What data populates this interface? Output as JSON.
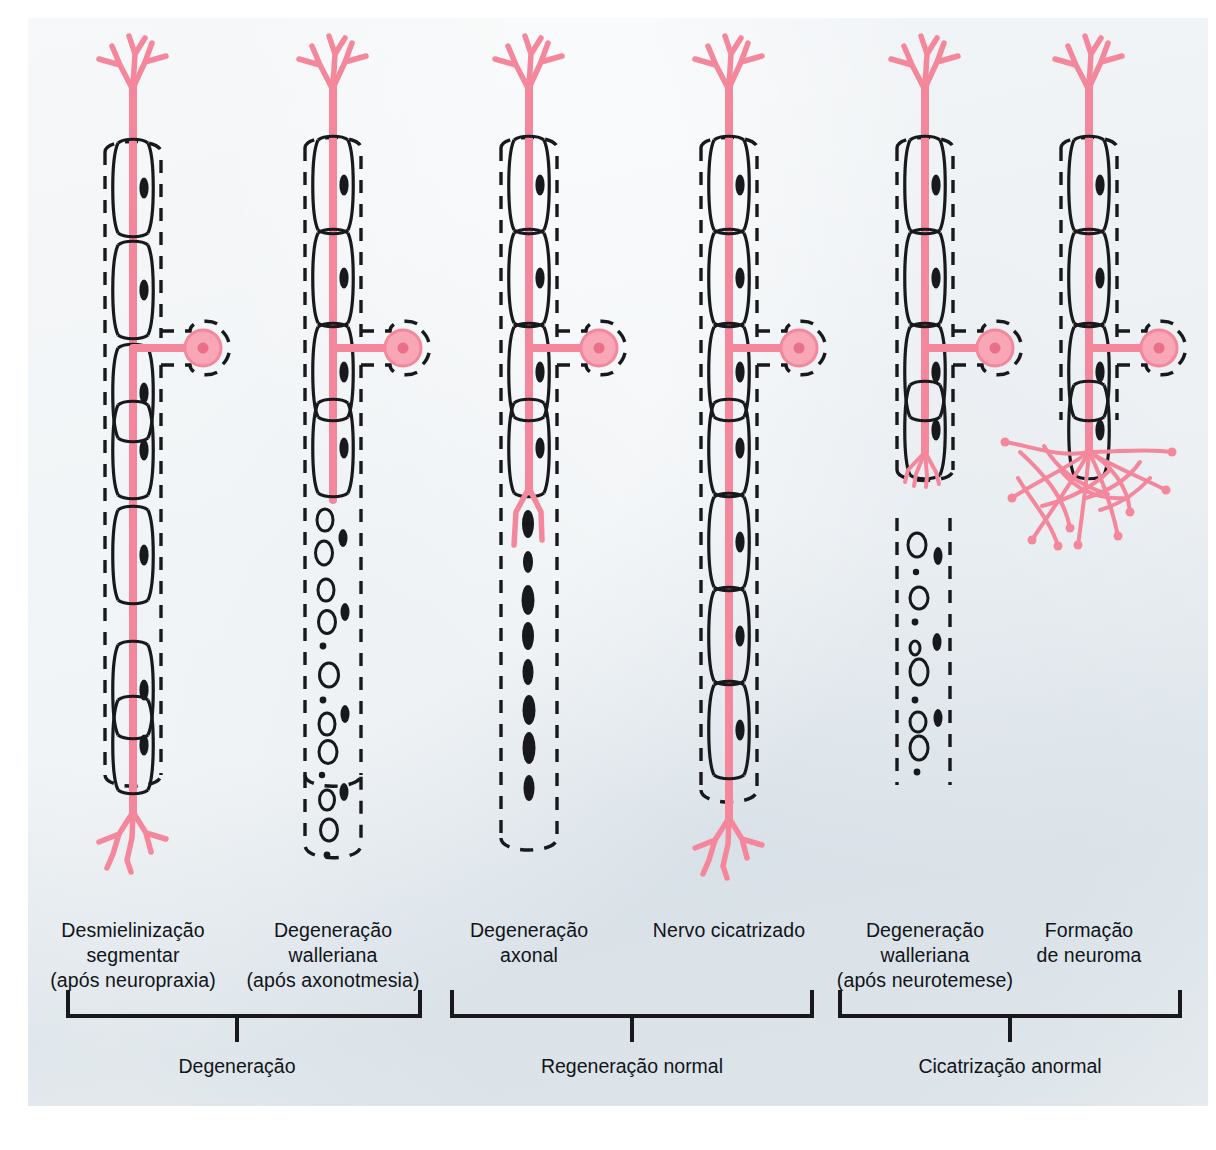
{
  "figure": {
    "background_color": "#e4eaee",
    "page_color": "#ffffff",
    "axon_color": "#f4879b",
    "axon_fill_color": "#f9a7b6",
    "nucleus_color": "#ea6f88",
    "ink_color": "#111418",
    "panel": {
      "x": 28,
      "y": 18,
      "width": 1180,
      "height": 1088
    }
  },
  "columns": [
    {
      "id": "col-1",
      "center_x": 133,
      "label_lines": [
        "Desmielinização",
        "segmentar",
        "(após neuropraxia)"
      ],
      "state": "segmental-demyelination",
      "axon_intact": true,
      "distal_terminal": true,
      "myelin_segments_present": "partial",
      "debris": false
    },
    {
      "id": "col-2",
      "center_x": 333,
      "label_lines": [
        "Degeneração",
        "walleriana",
        "(após axonotmesia)"
      ],
      "state": "wallerian-degeneration-axonotmesis",
      "axon_intact": false,
      "distal_terminal": false,
      "myelin_segments_present": "proximal-only",
      "debris": true
    },
    {
      "id": "col-3",
      "center_x": 529,
      "label_lines": [
        "Degeneração",
        "axonal"
      ],
      "state": "axonal-degeneration",
      "axon_intact": false,
      "distal_terminal": false,
      "myelin_segments_present": "proximal-only",
      "debris": false,
      "bands_of_bungner": true
    },
    {
      "id": "col-4",
      "center_x": 729,
      "label_lines": [
        "Nervo cicatrizado"
      ],
      "state": "healed-nerve",
      "axon_intact": true,
      "distal_terminal": true,
      "myelin_segments_present": "full",
      "debris": false
    },
    {
      "id": "col-5",
      "center_x": 925,
      "label_lines": [
        "Degeneração",
        "walleriana",
        "(após neurotemese)"
      ],
      "state": "wallerian-degeneration-neurotmesis",
      "axon_intact": false,
      "distal_terminal": false,
      "myelin_segments_present": "proximal-only",
      "debris": true,
      "nerve_gap": true
    },
    {
      "id": "col-6",
      "center_x": 1089,
      "label_lines": [
        "Formação",
        "de neuroma"
      ],
      "state": "neuroma-formation",
      "axon_intact": false,
      "distal_terminal": false,
      "myelin_segments_present": "proximal-only",
      "debris": false,
      "neuroma": true
    }
  ],
  "column_labels_top": 918,
  "groups": [
    {
      "id": "group-degeneration",
      "label": "Degeneração",
      "left_x": 68,
      "right_x": 420,
      "tick_x": 237,
      "bracket_y": 1014,
      "label_y": 1065
    },
    {
      "id": "group-normal-regeneration",
      "label": "Regeneração normal",
      "left_x": 452,
      "right_x": 812,
      "tick_x": 632,
      "bracket_y": 1014,
      "label_y": 1065
    },
    {
      "id": "group-abnormal-healing",
      "label": "Cicatrização anormal",
      "left_x": 840,
      "right_x": 1180,
      "tick_x": 1010,
      "bracket_y": 1014,
      "label_y": 1065
    }
  ],
  "legend_semantics": {
    "axon": "pink axon fiber",
    "myelin_sheath": "solid black elliptical myelin segment",
    "schwann_nucleus": "small black oval nucleus",
    "endoneurium": "dashed black outer tube",
    "cell_body": "pink Schwann cell body with nucleus",
    "myelin_ovoid": "open black oval debris",
    "band_of_bungner": "solid black spindle"
  }
}
